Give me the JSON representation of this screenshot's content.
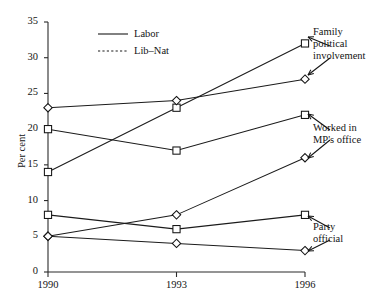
{
  "figure": {
    "clipped_header": "can decrease",
    "legend": {
      "items": [
        {
          "label": "Labor",
          "style": "solid",
          "marker": "square"
        },
        {
          "label": "Lib–Nat",
          "style": "dashed",
          "marker": "diamond"
        }
      ]
    },
    "annotations": [
      {
        "id": "family",
        "text": "Family\npolitical\ninvolvement"
      },
      {
        "id": "mp-office",
        "text": "Worked in\nMP's office"
      },
      {
        "id": "party-official",
        "text": "Party\nofficial"
      }
    ]
  },
  "chart_data": {
    "type": "line",
    "title": "",
    "xlabel": "",
    "ylabel": "Per cent",
    "categories": [
      "1990",
      "1993",
      "1996"
    ],
    "x": [
      1990,
      1993,
      1996
    ],
    "ylim": [
      0,
      35
    ],
    "xlim": [
      1990,
      1996
    ],
    "yticks": [
      0,
      5,
      10,
      15,
      20,
      25,
      30,
      35
    ],
    "ytick_labels": [
      "0",
      "5",
      "10",
      "15",
      "20",
      "25",
      "30",
      "35"
    ],
    "xticks": [
      1990,
      1993,
      1996
    ],
    "xtick_labels": [
      "1990",
      "1993",
      "1996"
    ],
    "grid": false,
    "legend_position": "upper-left-inside",
    "series": [
      {
        "name": "Family political involvement — Labor",
        "group": "Family political involvement",
        "party": "Labor",
        "marker": "square",
        "values": [
          14,
          23,
          32
        ]
      },
      {
        "name": "Family political involvement — Lib–Nat",
        "group": "Family political involvement",
        "party": "Lib–Nat",
        "marker": "diamond",
        "values": [
          23,
          24,
          27
        ]
      },
      {
        "name": "Worked in MP's office — Labor",
        "group": "Worked in MP's office",
        "party": "Labor",
        "marker": "square",
        "values": [
          20,
          17,
          22
        ]
      },
      {
        "name": "Worked in MP's office — Lib–Nat",
        "group": "Worked in MP's office",
        "party": "Lib–Nat",
        "marker": "diamond",
        "values": [
          5,
          8,
          16
        ]
      },
      {
        "name": "Party official — Labor",
        "group": "Party official",
        "party": "Labor",
        "marker": "square",
        "values": [
          8,
          6,
          8
        ]
      },
      {
        "name": "Party official — Lib–Nat",
        "group": "Party official",
        "party": "Lib–Nat",
        "marker": "diamond",
        "values": [
          5,
          4,
          3
        ]
      }
    ]
  }
}
